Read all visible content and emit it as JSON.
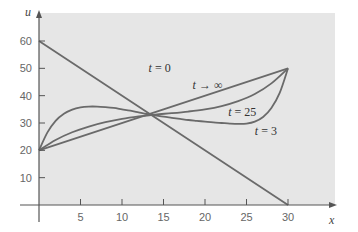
{
  "chart_data": {
    "type": "line",
    "title": "",
    "xlabel": "x",
    "ylabel": "u",
    "xlim": [
      0,
      30
    ],
    "ylim": [
      0,
      60
    ],
    "xticks": [
      5,
      10,
      15,
      20,
      25,
      30
    ],
    "yticks": [
      10,
      20,
      30,
      40,
      50,
      60
    ],
    "grid": false,
    "legend": "inline labels",
    "series": [
      {
        "name": "t = 0",
        "label_parts": [
          "t",
          " = 0"
        ],
        "label_pos": [
          13.2,
          48.5
        ],
        "x": [
          0,
          30
        ],
        "y": [
          60,
          0
        ]
      },
      {
        "name": "t = 3",
        "label_parts": [
          "t",
          " = 3"
        ],
        "label_pos": [
          26.0,
          25.5
        ],
        "x": [
          0,
          1,
          2,
          3,
          4,
          5,
          6,
          7,
          8,
          9,
          10,
          11,
          12,
          13,
          14,
          15,
          16,
          17,
          18,
          19,
          20,
          21,
          22,
          23,
          24,
          25,
          26,
          27,
          28,
          29,
          30
        ],
        "y": [
          20,
          26.5,
          30.8,
          33.4,
          34.9,
          35.7,
          36.0,
          36.0,
          35.8,
          35.5,
          35.0,
          34.5,
          33.9,
          33.3,
          32.8,
          32.3,
          31.9,
          31.5,
          31.1,
          30.8,
          30.5,
          30.2,
          30.0,
          29.8,
          29.7,
          29.8,
          30.5,
          32.2,
          35.5,
          41.0,
          50.0
        ]
      },
      {
        "name": "t = 25",
        "label_parts": [
          "t",
          " = 25"
        ],
        "label_pos": [
          22.8,
          32.4
        ],
        "x": [
          0,
          2,
          4,
          6,
          8,
          10,
          12,
          14,
          16,
          18,
          20,
          22,
          24,
          26,
          28,
          30
        ],
        "y": [
          20,
          23.8,
          26.6,
          28.7,
          30.3,
          31.5,
          32.4,
          33.1,
          33.6,
          34.2,
          35.0,
          36.2,
          38.0,
          40.6,
          44.5,
          50.0
        ]
      },
      {
        "name": "t → ∞",
        "label_parts": [
          "t",
          " → ∞"
        ],
        "label_pos": [
          18.5,
          42.3
        ],
        "x": [
          0,
          30
        ],
        "y": [
          20,
          50
        ]
      }
    ]
  },
  "colors": {
    "panel": "#e6e6e6",
    "curve": "#6a6a6a",
    "axis": "#555555"
  }
}
